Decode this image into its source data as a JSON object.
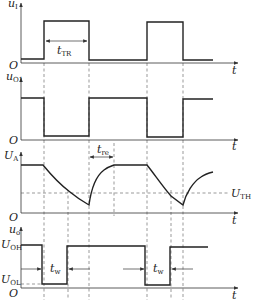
{
  "figure": {
    "colors": {
      "line": "#222222",
      "background": "#ffffff",
      "dashed": "#555555"
    }
  },
  "panels": [
    {
      "id": "ui",
      "y_label_main": "u",
      "y_label_sub": "I",
      "x_label": "t",
      "origin_label": "O",
      "annotation": {
        "main": "t",
        "sub": "TR"
      }
    },
    {
      "id": "uo1",
      "y_label_main": "u",
      "y_label_sub": "O1",
      "x_label": "t",
      "origin_label": "O"
    },
    {
      "id": "UA",
      "y_label_main": "U",
      "y_label_sub": "A",
      "x_label": "t",
      "origin_label": "O",
      "annotation": {
        "main": "t",
        "sub": "re"
      },
      "threshold": {
        "main": "U",
        "sub": "TH"
      }
    },
    {
      "id": "uo",
      "y_label_main": "u",
      "y_label_sub": "o",
      "x_label": "t",
      "origin_label": "O",
      "level_high": {
        "main": "U",
        "sub": "OH"
      },
      "level_low": {
        "main": "U",
        "sub": "OL"
      },
      "pulse_width_1": {
        "main": "t",
        "sub": "w"
      },
      "pulse_width_2": {
        "main": "t",
        "sub": "w"
      }
    }
  ]
}
